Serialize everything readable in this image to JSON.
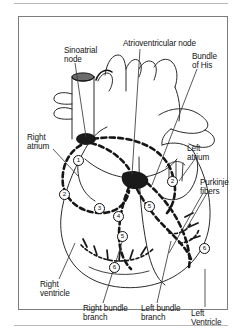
{
  "figure": {
    "frame": {
      "border_color": "#7c7c7c",
      "background": "#ffffff"
    },
    "labels": [
      {
        "id": "sinoatrial-node",
        "text": "Sinoatrial\nnode"
      },
      {
        "id": "atrioventricular-node",
        "text": "Atrioventricular node"
      },
      {
        "id": "bundle-of-his",
        "text": "Bundle\nof His"
      },
      {
        "id": "right-atrium",
        "text": "Right\natrium"
      },
      {
        "id": "left-atrium",
        "text": "Left\natrium"
      },
      {
        "id": "purkinje-fibers",
        "text": "Purkinje\nfibers"
      },
      {
        "id": "right-ventricle",
        "text": "Right\nventricle"
      },
      {
        "id": "right-bundle-branch",
        "text": "Right bundle\nbranch"
      },
      {
        "id": "left-bundle-branch",
        "text": "Left bundle\nbranch"
      },
      {
        "id": "left-ventricle",
        "text": "Left Ventricle"
      }
    ],
    "markers": [
      {
        "id": "marker-1",
        "text": "1"
      },
      {
        "id": "marker-2-right",
        "text": "2"
      },
      {
        "id": "marker-2-left",
        "text": "2"
      },
      {
        "id": "marker-3",
        "text": "3"
      },
      {
        "id": "marker-4",
        "text": "4"
      },
      {
        "id": "marker-5-upper",
        "text": "5"
      },
      {
        "id": "marker-5-lower",
        "text": "5"
      },
      {
        "id": "marker-6-left",
        "text": "6"
      },
      {
        "id": "marker-6-right",
        "text": "6"
      }
    ],
    "colors": {
      "ink": "#141414",
      "conduction_path": "#161616",
      "outline": "#2a2a2a",
      "rule": "#b9b9b9"
    }
  }
}
